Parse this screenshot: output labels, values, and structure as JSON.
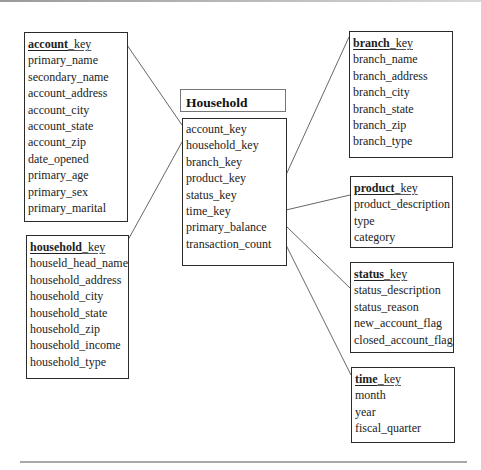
{
  "diagram": {
    "type": "star-schema",
    "fact_title": "Household Facts",
    "fact_table": {
      "fields": [
        "account_key",
        "household_key",
        "branch_key",
        "product_key",
        "status_key",
        "time_key",
        "primary_balance",
        "transaction_count"
      ]
    },
    "dimensions": {
      "account": {
        "key_name": "account",
        "key_suffix": "_key",
        "fields": [
          "primary_name",
          "secondary_name",
          "account_address",
          "account_city",
          "account_state",
          "account_zip",
          "date_opened",
          "primary_age",
          "primary_sex",
          "primary_marital"
        ]
      },
      "household": {
        "key_name": "household",
        "key_suffix": "_key",
        "fields": [
          "houseld_head_name",
          "household_address",
          "household_city",
          "household_state",
          "household_zip",
          "household_income",
          "household_type"
        ]
      },
      "branch": {
        "key_name": "branch",
        "key_suffix": "_key",
        "fields": [
          "branch_name",
          "branch_address",
          "branch_city",
          "branch_state",
          "branch_zip",
          "branch_type"
        ]
      },
      "product": {
        "key_name": "product",
        "key_suffix": "_key",
        "fields": [
          "product_description",
          "type",
          "category"
        ]
      },
      "status": {
        "key_name": "status",
        "key_suffix": "_key",
        "fields": [
          "status_description",
          "status_reason",
          "new_account_flag",
          "closed_account_flag"
        ]
      },
      "time": {
        "key_name": "time",
        "key_suffix": "_key",
        "fields": [
          "month",
          "year",
          "fiscal_quarter"
        ]
      }
    },
    "relationships": [
      {
        "from": "account",
        "to": "fact"
      },
      {
        "from": "household",
        "to": "fact"
      },
      {
        "from": "fact",
        "to": "branch"
      },
      {
        "from": "fact",
        "to": "product"
      },
      {
        "from": "fact",
        "to": "status"
      },
      {
        "from": "fact",
        "to": "time"
      }
    ],
    "colors": {
      "border": "#2b2b2b",
      "line": "#555555",
      "text": "#222222",
      "background": "#ffffff"
    }
  }
}
